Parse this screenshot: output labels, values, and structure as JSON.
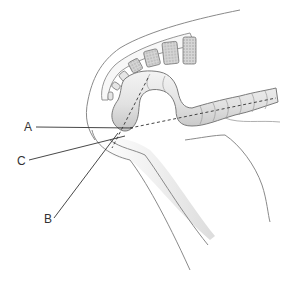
{
  "figure": {
    "labels": [
      {
        "id": "A",
        "text": "A",
        "x": 24,
        "y": 121
      },
      {
        "id": "C",
        "text": "C",
        "x": 17,
        "y": 155
      },
      {
        "id": "B",
        "text": "B",
        "x": 44,
        "y": 213
      }
    ],
    "colors": {
      "outline": "#7a7a7a",
      "shade": "#d8d8d8",
      "bone_fill": "#bdbdbd",
      "leader": "#333333",
      "background": "#ffffff"
    }
  }
}
